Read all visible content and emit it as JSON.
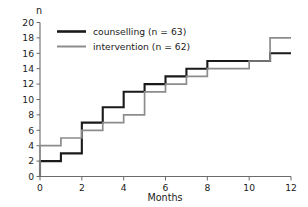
{
  "chart_data": {
    "type": "line",
    "title": "",
    "subtitle": "",
    "xlabel": "Months",
    "ylabel": "n",
    "xlim": [
      0,
      12
    ],
    "ylim": [
      0,
      20
    ],
    "xticks": [
      0,
      2,
      4,
      6,
      8,
      10,
      12
    ],
    "yticks": [
      0,
      2,
      4,
      6,
      8,
      10,
      12,
      14,
      16,
      18,
      20
    ],
    "grid": false,
    "legend_position": "top-left",
    "interpolation": "step-after",
    "x": [
      0,
      1,
      2,
      3,
      4,
      5,
      6,
      7,
      8,
      9,
      10,
      11,
      12
    ],
    "series": [
      {
        "name": "counselling (n = 63)",
        "color": "#1a1a1a",
        "width": 2.1,
        "values": [
          2,
          3,
          7,
          9,
          11,
          12,
          13,
          14,
          15,
          15,
          15,
          16,
          16
        ],
        "start_value": 0
      },
      {
        "name": "intervention (n = 62)",
        "color": "#8c8c8c",
        "width": 1.7,
        "values": [
          4,
          5,
          6,
          7,
          8,
          11,
          12,
          13,
          14,
          14,
          15,
          18,
          18
        ],
        "start_value": 0
      }
    ]
  },
  "axes": {
    "y_axis_label": "n",
    "x_axis_label": "Months",
    "y_tick_labels": [
      "0",
      "2",
      "4",
      "6",
      "8",
      "10",
      "12",
      "14",
      "16",
      "18",
      "20"
    ],
    "x_tick_labels": [
      "0",
      "2",
      "4",
      "6",
      "8",
      "10",
      "12"
    ]
  },
  "legend": {
    "entries": [
      {
        "label": "counselling (n = 63)",
        "swatch": "black-line-swatch"
      },
      {
        "label": "intervention (n = 62)",
        "swatch": "gray-line-swatch"
      }
    ]
  },
  "colors": {
    "counselling": "#1a1a1a",
    "intervention": "#8c8c8c",
    "axis": "#6b6b6b",
    "background": "#ffffff"
  }
}
